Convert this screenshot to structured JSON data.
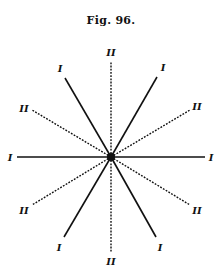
{
  "figure": {
    "title": "Fig. 96.",
    "center": [
      111,
      157
    ],
    "line_color": "#111111",
    "rays": [
      {
        "label": "II",
        "style": "dashed",
        "end": [
          111,
          62
        ],
        "label_pos": [
          111,
          56
        ]
      },
      {
        "label": "I",
        "style": "solid",
        "end": [
          157,
          77
        ],
        "label_pos": [
          163,
          71
        ]
      },
      {
        "label": "II",
        "style": "dashed",
        "end": [
          190,
          110
        ],
        "label_pos": [
          197,
          110
        ]
      },
      {
        "label": "I",
        "style": "solid",
        "end": [
          205,
          157
        ],
        "label_pos": [
          211,
          161
        ]
      },
      {
        "label": "II",
        "style": "dashed",
        "end": [
          190,
          205
        ],
        "label_pos": [
          197,
          214
        ]
      },
      {
        "label": "I",
        "style": "solid",
        "end": [
          156,
          237
        ],
        "label_pos": [
          160,
          251
        ]
      },
      {
        "label": "II",
        "style": "dashed",
        "end": [
          111,
          252
        ],
        "label_pos": [
          111,
          265
        ]
      },
      {
        "label": "I",
        "style": "solid",
        "end": [
          64,
          237
        ],
        "label_pos": [
          59,
          251
        ]
      },
      {
        "label": "II",
        "style": "dashed",
        "end": [
          32,
          205
        ],
        "label_pos": [
          24,
          214
        ]
      },
      {
        "label": "I",
        "style": "solid",
        "end": [
          17,
          157
        ],
        "label_pos": [
          10,
          161
        ]
      },
      {
        "label": "II",
        "style": "dashed",
        "end": [
          32,
          110
        ],
        "label_pos": [
          24,
          112
        ]
      },
      {
        "label": "I",
        "style": "solid",
        "end": [
          65,
          78
        ],
        "label_pos": [
          60,
          72
        ]
      }
    ]
  }
}
